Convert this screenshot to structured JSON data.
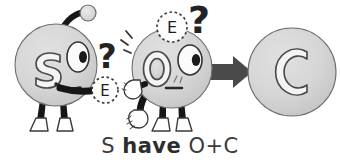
{
  "figure": {
    "type": "cartoon-diagram",
    "background_color": "#ffffff",
    "caption": {
      "full_text": "S have O+C",
      "segment_subject": "S",
      "segment_verb": "have",
      "segment_object": "O+C",
      "space": " ",
      "color": "#3b3b3b"
    },
    "palette": {
      "body_fill": "#d2d2d2",
      "body_fill_light": "#dcdcdc",
      "outline": "#3a3a3a",
      "ink_black": "#1a1a1a",
      "arrow_gray": "#4a4a4a",
      "letter_fill": "#f2f2f2",
      "boot_fill": "#ffffff"
    },
    "characters": [
      {
        "id": "char-s",
        "letter": "S",
        "role": "giver",
        "has_antenna": true,
        "antenna_tip_color": "#d8d8d8",
        "expression": "smiling",
        "holding": "E",
        "thought_marks": [
          "?"
        ]
      },
      {
        "id": "char-o",
        "letter": "O",
        "role": "receiver",
        "has_antenna": false,
        "expression": "neutral",
        "thought_bubble": "E",
        "thought_marks": [
          "?"
        ],
        "motion_lines": true
      }
    ],
    "electron_labels": [
      {
        "id": "electron-near-s",
        "text": "E",
        "style": "dashed-circle"
      },
      {
        "id": "electron-above-o",
        "text": "E",
        "style": "dashed-circle"
      }
    ],
    "question_marks": [
      {
        "id": "question-mark-left",
        "text": "?"
      },
      {
        "id": "question-mark-right",
        "text": "?"
      }
    ],
    "arrow": {
      "id": "result-arrow",
      "direction": "right",
      "color": "#4a4a4a"
    },
    "result": {
      "id": "result-circle",
      "letter": "C",
      "fill": "#d2d2d2"
    }
  }
}
